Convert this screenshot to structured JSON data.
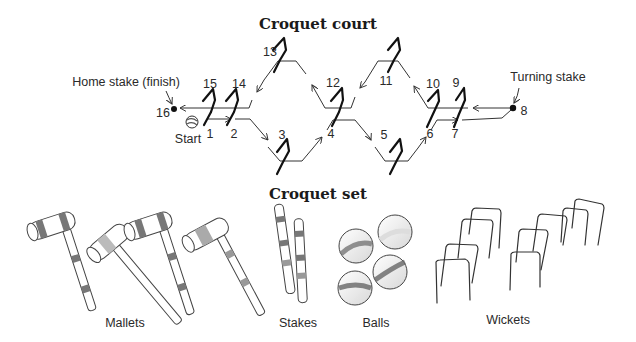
{
  "court": {
    "title": "Croquet court",
    "home_stake_label": "Home stake (finish)",
    "turning_stake_label": "Turning stake",
    "start_label": "Start",
    "wicket_numbers": {
      "w1": "1",
      "w2": "2",
      "w3": "3",
      "w4": "4",
      "w5": "5",
      "w6": "6",
      "w7": "7",
      "w8": "8",
      "w9": "9",
      "w10": "10",
      "w11": "11",
      "w12": "12",
      "w13": "13",
      "w14": "14",
      "w15": "15",
      "w16": "16"
    }
  },
  "set": {
    "title": "Croquet set",
    "items": [
      {
        "label": "Mallets"
      },
      {
        "label": "Stakes"
      },
      {
        "label": "Balls"
      },
      {
        "label": "Wickets"
      }
    ]
  },
  "colors": {
    "ink": "#1a1a1a",
    "stripe": "#6b6b6b",
    "background": "#ffffff"
  }
}
